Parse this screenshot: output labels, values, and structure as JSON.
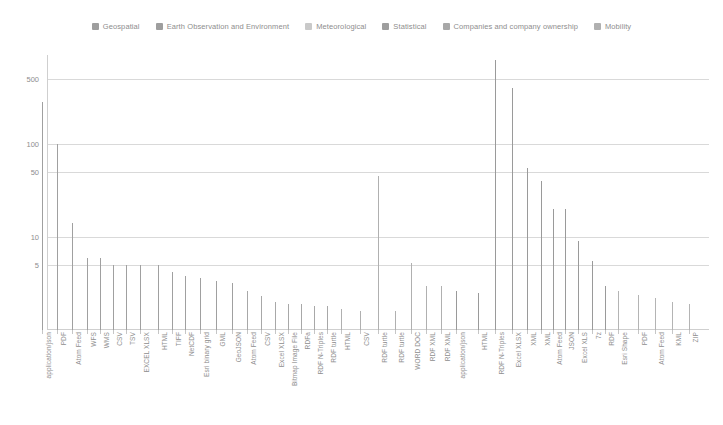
{
  "legend": {
    "position": "top-center",
    "items": [
      {
        "label": "Geospatial",
        "color": "#9e9e9e"
      },
      {
        "label": "Earth Observation and Environment",
        "color": "#9e9e9e"
      },
      {
        "label": "Meteorological",
        "color": "#c9c9c9"
      },
      {
        "label": "Statistical",
        "color": "#9e9e9e"
      },
      {
        "label": "Companies and company ownership",
        "color": "#a8a8a8"
      },
      {
        "label": "Mobility",
        "color": "#b0b0b0"
      }
    ]
  },
  "chart_data": {
    "type": "bar",
    "title": "",
    "xlabel": "",
    "ylabel": "",
    "yscale": "log",
    "ylim": [
      1,
      900
    ],
    "yticks": [
      5,
      10,
      50,
      100,
      500
    ],
    "ytick_labels": [
      "5",
      "10",
      "50",
      "100",
      "500"
    ],
    "grid": true,
    "categories": [
      "application/json",
      "PDF",
      "Atom Feed",
      "WFS",
      "WMS",
      "CSV",
      "TSV",
      "EXCEL XLSX",
      "HTML",
      "TIFF",
      "NetCDF",
      "Esri binary grid",
      "GML",
      "GeoJSON",
      "Atom Feed",
      "CSV",
      "Excel XLSX",
      "Bitmap Image File",
      "RDFa",
      "RDF N-Triples",
      "RDF turtle",
      "HTML",
      "CSV",
      "RDF turtle",
      "RDF turtle",
      "WORD DOC",
      "RDF XML",
      "RDF XML",
      "application/json",
      "HTML",
      "RDF N-Triples",
      "Excel XLSX",
      "XML",
      "XML",
      "Atom Feed",
      "JSON",
      "Excel XLS",
      "7z",
      "RDF",
      "Esri Shape",
      "PDF",
      "Atom Feed",
      "KML",
      "ZIP"
    ],
    "values": [
      280,
      100,
      14,
      6,
      6,
      5,
      5,
      5,
      5,
      4.2,
      3.8,
      3.6,
      3.4,
      3.2,
      2.6,
      2.3,
      2.0,
      1.9,
      1.9,
      1.8,
      1.8,
      1.7,
      1.6,
      45,
      1.6,
      5.2,
      3.0,
      3.0,
      2.6,
      2.5,
      800,
      400,
      55,
      40,
      20,
      20,
      9,
      5.5,
      3.0,
      2.6,
      2.4,
      2.2,
      2.0,
      1.9
    ],
    "bar_colors": [
      "#a0a0a0",
      "#a0a0a0",
      "#a0a0a0",
      "#a0a0a0",
      "#a0a0a0",
      "#a0a0a0",
      "#a0a0a0",
      "#a0a0a0",
      "#a0a0a0",
      "#a0a0a0",
      "#a0a0a0",
      "#a0a0a0",
      "#a0a0a0",
      "#a0a0a0",
      "#a8a8a8",
      "#a8a8a8",
      "#a8a8a8",
      "#a8a8a8",
      "#a8a8a8",
      "#a8a8a8",
      "#a8a8a8",
      "#b0b0b0",
      "#b0b0b0",
      "#b0b0b0",
      "#b0b0b0",
      "#b0b0b0",
      "#b0b0b0",
      "#b0b0b0",
      "#9a9a9a",
      "#9a9a9a",
      "#9a9a9a",
      "#9a9a9a",
      "#9a9a9a",
      "#9a9a9a",
      "#9a9a9a",
      "#9a9a9a",
      "#9a9a9a",
      "#9a9a9a",
      "#9a9a9a",
      "#b4b4b4",
      "#b4b4b4",
      "#b4b4b4",
      "#b4b4b4",
      "#b4b4b4"
    ],
    "bar_x": [
      42,
      57,
      72,
      87,
      100,
      113,
      126,
      140,
      158,
      172,
      185,
      200,
      216,
      232,
      247,
      261,
      275,
      288,
      301,
      314,
      327,
      341,
      360,
      378,
      395,
      411,
      426,
      441,
      456,
      478,
      495,
      512,
      527,
      541,
      553,
      565,
      578,
      592,
      605,
      618,
      638,
      655,
      672,
      689
    ]
  }
}
